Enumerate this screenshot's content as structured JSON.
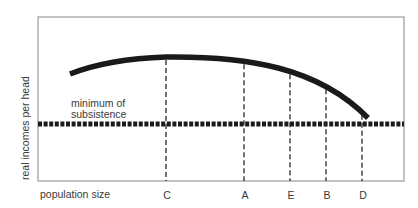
{
  "diagram": {
    "y_axis_label": "real incomes per head",
    "x_axis_label": "population size",
    "subsistence_label_line1": "minimum of",
    "subsistence_label_line2": "subsistence",
    "frame": {
      "left": 38,
      "top": 17,
      "right": 404,
      "bottom": 181,
      "color": "#9a9a9a"
    },
    "curve": {
      "description": "income per head vs population size, rising to a maximum then falling",
      "color": "#1a1a1a",
      "start": [
        70,
        74
      ],
      "peak": [
        166,
        57
      ],
      "end": [
        368,
        118
      ]
    },
    "subsistence_line": {
      "y": 124,
      "x_start": 38,
      "x_end": 404,
      "color": "#1a1a1a"
    },
    "population_markers": [
      {
        "label": "C",
        "x": 166,
        "note": "optimum population (peak income)"
      },
      {
        "label": "A",
        "x": 244
      },
      {
        "label": "E",
        "x": 290
      },
      {
        "label": "B",
        "x": 326
      },
      {
        "label": "D",
        "x": 362,
        "note": "income falls to subsistence"
      }
    ]
  }
}
